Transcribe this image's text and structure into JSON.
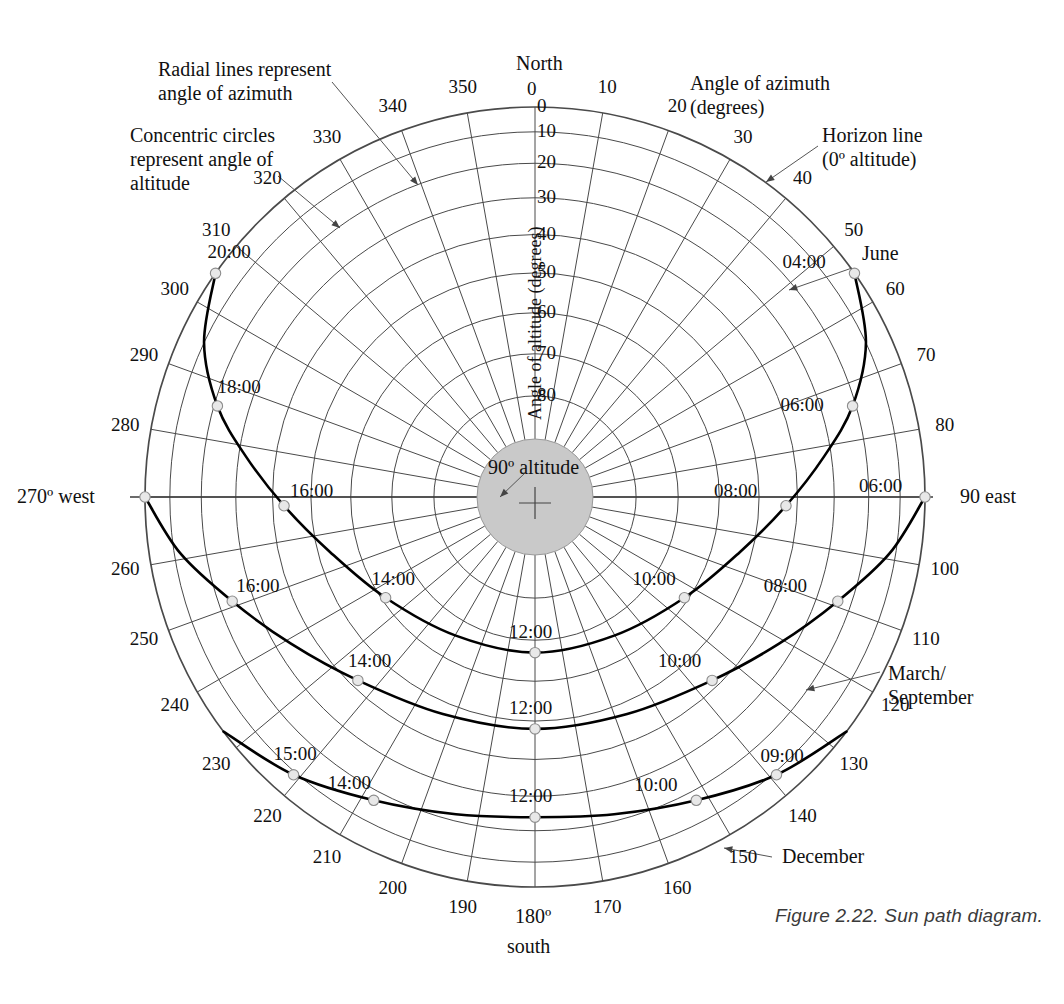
{
  "figure": {
    "caption": "Figure 2.22. Sun path diagram.",
    "title": "Sun path diagram"
  },
  "axis_titles": {
    "altitude": "Angle of altitude (degrees)",
    "azimuth_line1": "Angle of azimuth",
    "azimuth_line2": "(degrees)"
  },
  "annotations": [
    {
      "name": "radial-lines-note",
      "line1": "Radial lines represent",
      "line2": "angle of azimuth"
    },
    {
      "name": "concentric-circles-note",
      "line1": "Concentric circles",
      "line2": "represent angle of",
      "line3": "altitude"
    },
    {
      "name": "horizon-line-note",
      "line1": "Horizon line",
      "line2": "(0º altitude)"
    },
    {
      "name": "center-note",
      "text": "90º altitude"
    }
  ],
  "cardinals": {
    "north_value": "0",
    "north_label": "North",
    "east_value": "90",
    "east_label": "east",
    "south_value": "180º",
    "south_label": "south",
    "west_value": "270º",
    "west_label": "west"
  },
  "azimuth_labels": [
    "0",
    "10",
    "20",
    "30",
    "40",
    "50",
    "60",
    "70",
    "80",
    "90",
    "100",
    "110",
    "120",
    "130",
    "140",
    "150",
    "160",
    "170",
    "180",
    "190",
    "200",
    "210",
    "220",
    "230",
    "240",
    "250",
    "260",
    "270",
    "280",
    "290",
    "300",
    "310",
    "320",
    "330",
    "340",
    "350"
  ],
  "altitude_labels": [
    "0",
    "10",
    "20",
    "30",
    "40",
    "50",
    "60",
    "70",
    "80"
  ],
  "season_labels": {
    "june": "June",
    "march_september_line1": "March/",
    "march_september_line2": "September",
    "december": "December"
  },
  "chart_data": {
    "type": "line",
    "title": "Sun path diagram",
    "projection": "polar-equidistant-altitude",
    "xlabel": "Angle of azimuth (degrees)",
    "ylabel": "Angle of altitude (degrees)",
    "azimuth_range": [
      0,
      360
    ],
    "azimuth_tick_step": 10,
    "altitude_range": [
      0,
      90
    ],
    "altitude_ticks": [
      0,
      10,
      20,
      30,
      40,
      50,
      60,
      70,
      80,
      90
    ],
    "grid": true,
    "legend": "inline-annotations",
    "series": [
      {
        "name": "June",
        "hour_markers": [
          "04:00",
          "06:00",
          "08:00",
          "10:00",
          "12:00",
          "14:00",
          "16:00",
          "18:00",
          "20:00"
        ],
        "points": [
          {
            "time": "04:00",
            "azimuth": 55,
            "altitude": 0
          },
          {
            "time": "05:00",
            "azimuth": 65,
            "altitude": 10
          },
          {
            "time": "06:00",
            "azimuth": 74,
            "altitude": 21
          },
          {
            "time": "07:00",
            "azimuth": 82,
            "altitude": 32
          },
          {
            "time": "08:00",
            "azimuth": 92,
            "altitude": 43
          },
          {
            "time": "09:00",
            "azimuth": 105,
            "altitude": 53
          },
          {
            "time": "10:00",
            "azimuth": 124,
            "altitude": 61
          },
          {
            "time": "11:00",
            "azimuth": 150,
            "altitude": 66
          },
          {
            "time": "12:00",
            "azimuth": 180,
            "altitude": 67
          },
          {
            "time": "13:00",
            "azimuth": 210,
            "altitude": 66
          },
          {
            "time": "14:00",
            "azimuth": 236,
            "altitude": 61
          },
          {
            "time": "15:00",
            "azimuth": 255,
            "altitude": 53
          },
          {
            "time": "16:00",
            "azimuth": 268,
            "altitude": 43
          },
          {
            "time": "17:00",
            "azimuth": 278,
            "altitude": 32
          },
          {
            "time": "18:00",
            "azimuth": 286,
            "altitude": 21
          },
          {
            "time": "19:00",
            "azimuth": 295,
            "altitude": 10
          },
          {
            "time": "20:00",
            "azimuth": 305,
            "altitude": 0
          }
        ]
      },
      {
        "name": "March/September",
        "hour_markers": [
          "06:00",
          "08:00",
          "10:00",
          "12:00",
          "14:00",
          "16:00",
          "18:00"
        ],
        "points": [
          {
            "time": "06:00",
            "azimuth": 90,
            "altitude": 0
          },
          {
            "time": "07:00",
            "azimuth": 99,
            "altitude": 12
          },
          {
            "time": "08:00",
            "azimuth": 109,
            "altitude": 24
          },
          {
            "time": "09:00",
            "azimuth": 121,
            "altitude": 34
          },
          {
            "time": "10:00",
            "azimuth": 136,
            "altitude": 42
          },
          {
            "time": "11:00",
            "azimuth": 157,
            "altitude": 47
          },
          {
            "time": "12:00",
            "azimuth": 180,
            "altitude": 48
          },
          {
            "time": "13:00",
            "azimuth": 203,
            "altitude": 47
          },
          {
            "time": "14:00",
            "azimuth": 224,
            "altitude": 42
          },
          {
            "time": "15:00",
            "azimuth": 239,
            "altitude": 34
          },
          {
            "time": "16:00",
            "azimuth": 251,
            "altitude": 24
          },
          {
            "time": "17:00",
            "azimuth": 261,
            "altitude": 12
          },
          {
            "time": "18:00",
            "azimuth": 270,
            "altitude": 0
          }
        ]
      },
      {
        "name": "December",
        "hour_markers": [
          "09:00",
          "10:00",
          "12:00",
          "14:00",
          "15:00"
        ],
        "points": [
          {
            "time": "08:00",
            "azimuth": 127,
            "altitude": 0
          },
          {
            "time": "09:00",
            "azimuth": 139,
            "altitude": 9
          },
          {
            "time": "10:00",
            "azimuth": 152,
            "altitude": 17
          },
          {
            "time": "11:00",
            "azimuth": 166,
            "altitude": 22
          },
          {
            "time": "12:00",
            "azimuth": 180,
            "altitude": 24
          },
          {
            "time": "13:00",
            "azimuth": 194,
            "altitude": 22
          },
          {
            "time": "14:00",
            "azimuth": 208,
            "altitude": 17
          },
          {
            "time": "15:00",
            "azimuth": 221,
            "altitude": 9
          },
          {
            "time": "16:00",
            "azimuth": 233,
            "altitude": 0
          }
        ]
      }
    ],
    "hour_label_placements": [
      {
        "series": "June",
        "label": "04:00",
        "azimuth": 55,
        "altitude": 0
      },
      {
        "series": "June",
        "label": "06:00",
        "azimuth": 74,
        "altitude": 21
      },
      {
        "series": "June",
        "label": "06:00",
        "azimuth": 90,
        "altitude": 0
      },
      {
        "series": "June",
        "label": "08:00",
        "azimuth": 92,
        "altitude": 43
      },
      {
        "series": "June",
        "label": "10:00",
        "azimuth": 124,
        "altitude": 61
      },
      {
        "series": "June",
        "label": "12:00",
        "azimuth": 180,
        "altitude": 67
      },
      {
        "series": "June",
        "label": "14:00",
        "azimuth": 236,
        "altitude": 61
      },
      {
        "series": "June",
        "label": "16:00",
        "azimuth": 268,
        "altitude": 43
      },
      {
        "series": "June",
        "label": "18:00",
        "azimuth": 286,
        "altitude": 21
      },
      {
        "series": "June",
        "label": "20:00",
        "azimuth": 305,
        "altitude": 0
      },
      {
        "series": "March/September",
        "label": "08:00",
        "azimuth": 109,
        "altitude": 24
      },
      {
        "series": "March/September",
        "label": "10:00",
        "azimuth": 136,
        "altitude": 42
      },
      {
        "series": "March/September",
        "label": "12:00",
        "azimuth": 180,
        "altitude": 48
      },
      {
        "series": "March/September",
        "label": "14:00",
        "azimuth": 224,
        "altitude": 42
      },
      {
        "series": "March/September",
        "label": "16:00",
        "azimuth": 251,
        "altitude": 24
      },
      {
        "series": "December",
        "label": "09:00",
        "azimuth": 139,
        "altitude": 9
      },
      {
        "series": "December",
        "label": "10:00",
        "azimuth": 152,
        "altitude": 17
      },
      {
        "series": "December",
        "label": "12:00",
        "azimuth": 180,
        "altitude": 24
      },
      {
        "series": "December",
        "label": "14:00",
        "azimuth": 208,
        "altitude": 17
      },
      {
        "series": "December",
        "label": "15:00",
        "azimuth": 221,
        "altitude": 9
      }
    ]
  },
  "colors": {
    "grid": "#4a4a4a",
    "path": "#000000",
    "center_disc": "#c9c9c9",
    "marker_fill": "#e8e8e8",
    "text": "#111111",
    "caption": "#3a3a3a"
  }
}
